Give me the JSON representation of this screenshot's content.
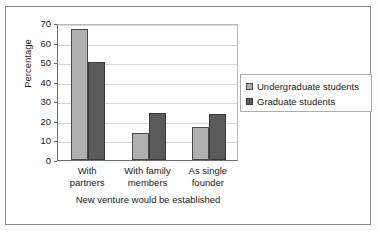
{
  "chart_data": {
    "type": "bar",
    "title": "",
    "xlabel": "New venture would be established",
    "ylabel": "Percentage",
    "categories": [
      "With partners",
      "With family members",
      "As single founder"
    ],
    "category_lines": [
      [
        "With",
        "partners"
      ],
      [
        "With family",
        "members"
      ],
      [
        "As single",
        "founder"
      ]
    ],
    "series": [
      {
        "name": "Undergraduate students",
        "values": [
          67,
          14,
          17
        ],
        "color": "#b0b0b0"
      },
      {
        "name": "Graduate students",
        "values": [
          50,
          24,
          23.5
        ],
        "color": "#5a5a5a"
      }
    ],
    "ylim": [
      0,
      70
    ],
    "ytick_step": 10,
    "yticks": [
      "0",
      "10",
      "20",
      "30",
      "40",
      "50",
      "60",
      "70"
    ],
    "grid": true,
    "legend_position": "right"
  },
  "legend": {
    "items": [
      {
        "label": "Undergraduate students",
        "swatch": "light-gray-square"
      },
      {
        "label": "Graduate students",
        "swatch": "dark-gray-square"
      }
    ]
  },
  "axes": {
    "y_title": "Percentage",
    "x_title": "New venture would be established"
  }
}
